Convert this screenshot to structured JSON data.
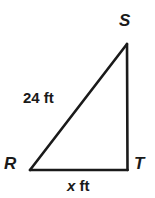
{
  "figure": {
    "type": "right-triangle-diagram",
    "shape_name": "triangle RST",
    "stroke_color": "#1a1a1a",
    "background_color": "#ffffff",
    "vertices": [
      {
        "name": "S",
        "label": "S",
        "x": 127,
        "y": 44
      },
      {
        "name": "R",
        "label": "R",
        "x": 30,
        "y": 170
      },
      {
        "name": "T",
        "label": "T",
        "x": 127,
        "y": 170
      }
    ],
    "sides": [
      {
        "name": "hypotenuse-RS",
        "label_text": "24 ft",
        "measure": "24",
        "unit": "ft"
      },
      {
        "name": "base-RT",
        "label_variable": "x",
        "label_unit": "ft",
        "label_text": "x ft"
      },
      {
        "name": "vertical-ST",
        "label_text": ""
      }
    ]
  },
  "labels": {
    "vertex_s": "S",
    "vertex_r": "R",
    "vertex_t": "T",
    "hypotenuse": "24 ft",
    "base_variable": "x",
    "base_unit": "ft"
  }
}
